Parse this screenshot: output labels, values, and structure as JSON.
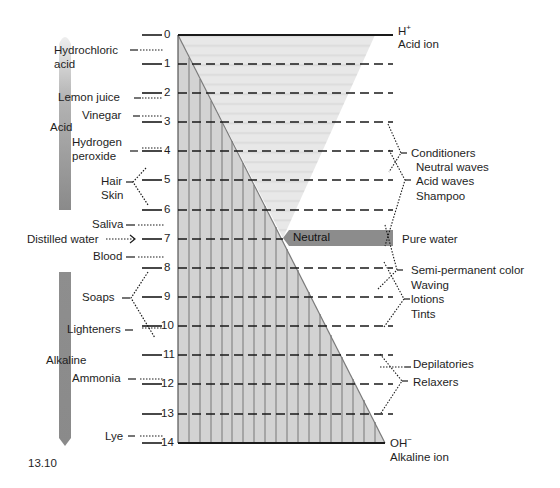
{
  "figure": {
    "number": "13.10",
    "scale_title_top": "H+",
    "scale_top_sup": "+",
    "scale_top_base": "H",
    "scale_top_caption": "Acid ion",
    "scale_bottom_base": "OH",
    "scale_bottom_sup": "−",
    "scale_bottom_caption": "Alkaline ion",
    "neutral_label": "Neutral",
    "pure_water_label": "Pure water",
    "acid_bar_label": "Acid",
    "alkaline_bar_label": "Alkaline",
    "colors": {
      "acid_region": "#e4e4e4",
      "alkaline_region": "#c9c9c9",
      "stripe": "#9a9a9a",
      "neutral_band": "#8c8c8c",
      "bar": "#8f8f8f",
      "line": "#1a1a1a"
    }
  },
  "scale": {
    "ticks": [
      "0",
      "1",
      "2",
      "3",
      "4",
      "5",
      "6",
      "7",
      "8",
      "9",
      "10",
      "11",
      "12",
      "13",
      "14"
    ]
  },
  "left_substances": [
    {
      "label": "Hydrochloric",
      "label2": "acid",
      "ph": 0.5
    },
    {
      "label": "Lemon juice",
      "ph": 2.2
    },
    {
      "label": "Vinegar",
      "ph": 2.8
    },
    {
      "label": "Hydrogen",
      "label2": "peroxide",
      "ph": 4.0
    },
    {
      "label": "Hair",
      "label2": "Skin",
      "ph_range": [
        4.5,
        5.5
      ]
    },
    {
      "label": "Saliva",
      "ph": 6.5
    },
    {
      "label": "Distilled water",
      "ph": 7.0
    },
    {
      "label": "Blood",
      "ph": 7.4
    },
    {
      "label": "Soaps",
      "ph_range": [
        8,
        10
      ]
    },
    {
      "label": "Lighteners",
      "ph": 10.0
    },
    {
      "label": "Ammonia",
      "ph": 11.8
    },
    {
      "label": "Lye",
      "ph": 13.8
    }
  ],
  "right_products": [
    {
      "label": "Conditioners",
      "ph_range": [
        3,
        4.5
      ]
    },
    {
      "label": "Neutral waves",
      "ph_range": [
        4,
        6
      ]
    },
    {
      "label": "Acid waves",
      "ph_range": [
        4,
        6
      ]
    },
    {
      "label": "Shampoo",
      "ph_range": [
        4,
        6
      ]
    },
    {
      "label": "Pure water",
      "ph": 7
    },
    {
      "label": "Semi-permanent color",
      "ph_range": [
        7,
        9
      ]
    },
    {
      "label": "Waving",
      "ph_range": [
        8,
        10
      ]
    },
    {
      "label": "lotions",
      "ph_range": [
        8,
        10
      ]
    },
    {
      "label": "Tints",
      "ph_range": [
        8,
        10
      ]
    },
    {
      "label": "Depilatories",
      "ph_range": [
        11,
        12
      ]
    },
    {
      "label": "Relaxers",
      "ph_range": [
        11,
        13
      ]
    }
  ]
}
